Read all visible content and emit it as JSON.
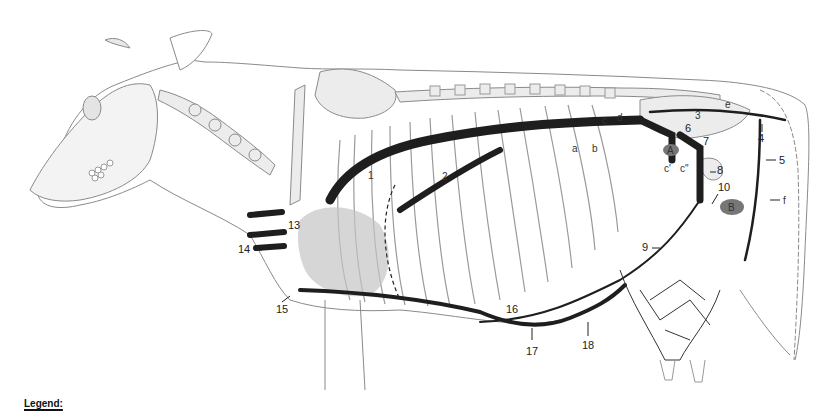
{
  "figure": {
    "legend_heading": "Legend:",
    "colors": {
      "outline": "#8a8a8a",
      "bone_fill": "#ececec",
      "vessel_dark": "#1e1e1e",
      "organ_shade": "#bdbdbd",
      "label": "#222222"
    },
    "number_labels": [
      {
        "id": "1",
        "text": "1"
      },
      {
        "id": "2",
        "text": "2"
      },
      {
        "id": "3",
        "text": "3"
      },
      {
        "id": "4",
        "text": "4"
      },
      {
        "id": "5",
        "text": "5"
      },
      {
        "id": "6",
        "text": "6"
      },
      {
        "id": "7",
        "text": "7"
      },
      {
        "id": "8",
        "text": "8"
      },
      {
        "id": "9",
        "text": "9"
      },
      {
        "id": "10",
        "text": "10"
      },
      {
        "id": "13",
        "text": "13"
      },
      {
        "id": "14",
        "text": "14"
      },
      {
        "id": "15",
        "text": "15"
      },
      {
        "id": "16",
        "text": "16"
      },
      {
        "id": "17",
        "text": "17"
      },
      {
        "id": "18",
        "text": "18"
      }
    ],
    "letter_labels": [
      {
        "id": "a",
        "text": "a"
      },
      {
        "id": "b",
        "text": "b"
      },
      {
        "id": "c",
        "text": "c"
      },
      {
        "id": "c1",
        "text": "c'"
      },
      {
        "id": "c2",
        "text": "c\""
      },
      {
        "id": "d",
        "text": "d"
      },
      {
        "id": "e",
        "text": "e"
      },
      {
        "id": "f",
        "text": "f"
      }
    ],
    "region_labels": [
      {
        "id": "A",
        "text": "A"
      },
      {
        "id": "B",
        "text": "B"
      }
    ]
  }
}
